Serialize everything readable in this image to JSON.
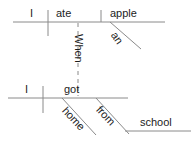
{
  "diagram": {
    "type": "reed-kellogg-sentence-diagram",
    "sentence": "When I got home from school I ate an apple",
    "line_color": "#8a8a8a",
    "text_color": "#1c1c1c",
    "background_color": "#ffffff",
    "clauses": {
      "main": {
        "name": "main-clause",
        "subject": "I",
        "verb": "ate",
        "direct_object": "apple",
        "modifiers": [
          {
            "word": "an",
            "modifies": "apple",
            "type": "article"
          }
        ]
      },
      "subordinate": {
        "name": "subordinate-clause",
        "subordinator": "When",
        "subject": "I",
        "verb": "got",
        "modifiers": [
          {
            "word": "home",
            "modifies": "got",
            "type": "adverb"
          },
          {
            "word": "from",
            "modifies": "got",
            "type": "preposition"
          }
        ],
        "prepositional_object": "school"
      }
    },
    "words": {
      "i_top": "I",
      "ate": "ate",
      "apple": "apple",
      "an": "an",
      "when": "When",
      "i_bottom": "I",
      "got": "got",
      "home": "home",
      "from": "from",
      "school": "school"
    }
  }
}
